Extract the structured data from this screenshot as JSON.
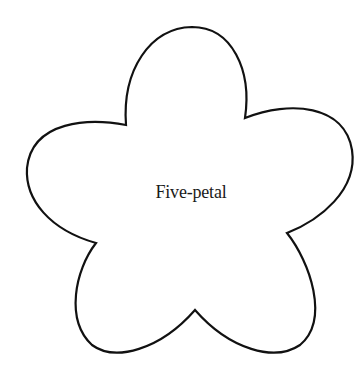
{
  "diagram": {
    "shape": "five-petal flower outline",
    "label": "Five-petal",
    "colors": {
      "stroke": "#111111",
      "fill": "#ffffff",
      "background": "#ffffff"
    }
  }
}
